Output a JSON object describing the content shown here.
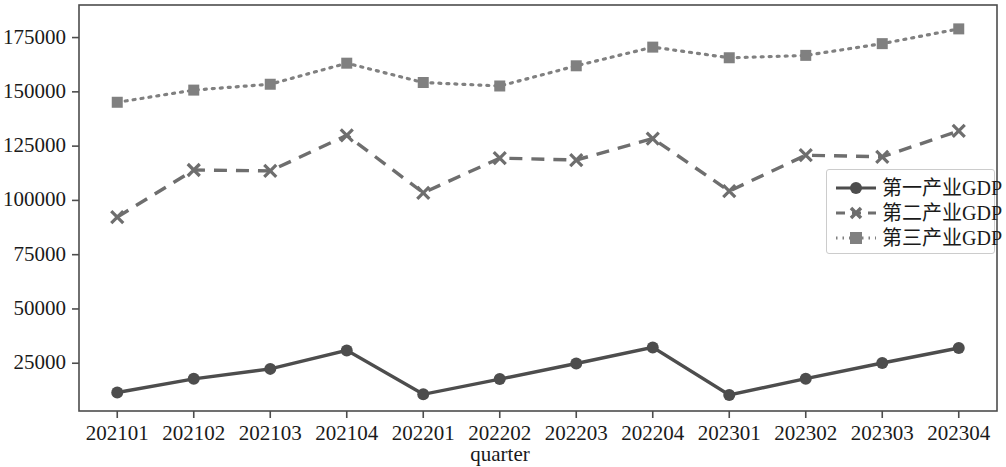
{
  "chart_data": {
    "type": "line",
    "title": "",
    "xlabel": "quarter",
    "ylabel": "",
    "categories": [
      "202101",
      "202102",
      "202103",
      "202104",
      "202201",
      "202202",
      "202203",
      "202204",
      "202301",
      "202302",
      "202303",
      "202304"
    ],
    "yticks": [
      "25000",
      "50000",
      "75000",
      "100000",
      "125000",
      "150000",
      "175000"
    ],
    "ytick_values": [
      25000,
      50000,
      75000,
      100000,
      125000,
      150000,
      175000
    ],
    "ylim": [
      3000,
      190000
    ],
    "grid": false,
    "legend_position": "center right",
    "series": [
      {
        "name": "第一产业GDP",
        "values": [
          11500,
          17800,
          22400,
          30900,
          10700,
          17700,
          24900,
          32300,
          10400,
          17900,
          25100,
          32000
        ],
        "linestyle": "solid",
        "marker": "circle",
        "color": "#4d4d4d"
      },
      {
        "name": "第二产业GDP",
        "values": [
          92300,
          114000,
          113600,
          130000,
          103500,
          119500,
          118600,
          128500,
          104300,
          120800,
          120100,
          132000
        ],
        "linestyle": "dashed",
        "marker": "x",
        "color": "#6e6e6e"
      },
      {
        "name": "第三产业GDP",
        "values": [
          145200,
          150800,
          153500,
          163200,
          154300,
          152700,
          162000,
          170600,
          165700,
          166800,
          172200,
          179000
        ],
        "linestyle": "dotted",
        "marker": "square",
        "color": "#808080"
      }
    ]
  },
  "axes": {
    "frame_color": "#4d4d4d",
    "background": "#ffffff"
  }
}
